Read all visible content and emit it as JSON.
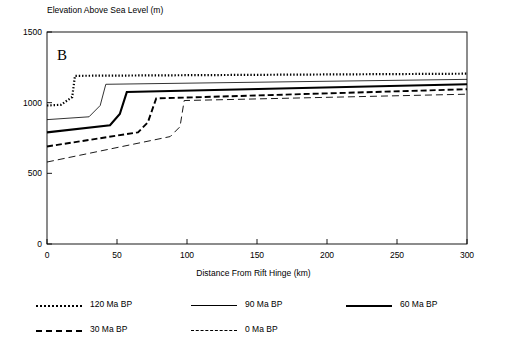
{
  "chart_data": {
    "type": "line",
    "title": "",
    "panel_label": "B",
    "xlabel": "Distance From Rift Hinge (km)",
    "ylabel": "Elevation Above Sea Level (m)",
    "xlim": [
      0,
      300
    ],
    "ylim": [
      0,
      1500
    ],
    "xticks": [
      0,
      50,
      100,
      150,
      200,
      250,
      300
    ],
    "yticks": [
      0,
      500,
      1000,
      1500
    ],
    "grid": false,
    "legend_position": "below",
    "series": [
      {
        "name": "120 Ma BP",
        "style": "dotted-marker",
        "x": [
          0,
          10,
          18,
          20,
          300
        ],
        "values": [
          980,
          985,
          1040,
          1190,
          1205
        ]
      },
      {
        "name": "90 Ma BP",
        "style": "thin-solid",
        "x": [
          0,
          30,
          38,
          42,
          300
        ],
        "values": [
          880,
          900,
          980,
          1130,
          1165
        ]
      },
      {
        "name": "60 Ma BP",
        "style": "thick-solid",
        "x": [
          0,
          45,
          52,
          57,
          300
        ],
        "values": [
          790,
          840,
          920,
          1075,
          1130
        ]
      },
      {
        "name": "30 Ma BP",
        "style": "dashed-thick",
        "x": [
          0,
          65,
          72,
          78,
          300
        ],
        "values": [
          690,
          790,
          860,
          1030,
          1095
        ]
      },
      {
        "name": "0 Ma BP",
        "style": "dashed-thin",
        "x": [
          0,
          88,
          95,
          98,
          300
        ],
        "values": [
          580,
          760,
          830,
          1015,
          1060
        ]
      }
    ]
  },
  "legend": {
    "rows": [
      [
        {
          "label": "120 Ma BP",
          "style": "dotted-marker"
        },
        {
          "label": "90 Ma BP",
          "style": "thin-solid"
        },
        {
          "label": "60 Ma BP",
          "style": "thick-solid"
        }
      ],
      [
        {
          "label": "30 Ma BP",
          "style": "dashed-thick"
        },
        {
          "label": "0 Ma BP",
          "style": "dashed-thin"
        }
      ]
    ]
  }
}
